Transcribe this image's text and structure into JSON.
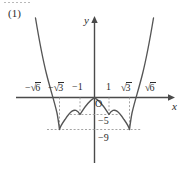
{
  "figure": {
    "index_label": "(1)",
    "axis": {
      "y_label": "y",
      "x_label": "x",
      "origin_label": "O"
    },
    "x_ticks": [
      {
        "id": "neg-sqrt6",
        "label": "-√6",
        "value": -2.449
      },
      {
        "id": "neg-sqrt3",
        "label": "-√3",
        "value": -1.732
      },
      {
        "id": "neg-one",
        "label": "-1",
        "value": -1
      },
      {
        "id": "pos-one",
        "label": "1",
        "value": 1
      },
      {
        "id": "pos-sqrt3",
        "label": "√3",
        "value": 1.732
      },
      {
        "id": "pos-sqrt6",
        "label": "√6",
        "value": 2.449
      }
    ],
    "y_ticks": [
      {
        "id": "neg-five",
        "label": "-5",
        "value": -5
      },
      {
        "id": "neg-nine",
        "label": "-9",
        "value": -9
      }
    ],
    "colors": {
      "curve": "#555555",
      "axis": "#4a4a4a",
      "guide": "#9a9a9a",
      "text": "#2b2b2b",
      "background": "#ffffff"
    }
  },
  "chart_data": {
    "type": "line",
    "title": "",
    "xlabel": "x",
    "ylabel": "y",
    "xlim": [
      -3.05,
      3.05
    ],
    "ylim": [
      -11.5,
      14.0
    ],
    "grid": false,
    "legend": null,
    "function": "y = x^4 - 6x^2",
    "roots": [
      -2.449,
      0,
      2.449
    ],
    "minima": [
      {
        "x": -1.732,
        "y": -9
      },
      {
        "x": 1.732,
        "y": -9
      }
    ],
    "local_maximum": {
      "x": 0,
      "y": 0
    },
    "marked_points": [
      {
        "x": -2.449,
        "y": 0,
        "label": "-√6"
      },
      {
        "x": -1.732,
        "y": -9,
        "label": "-√3"
      },
      {
        "x": -1,
        "y": -5,
        "label": "-1"
      },
      {
        "x": 1,
        "y": -5,
        "label": "1"
      },
      {
        "x": 1.732,
        "y": -9,
        "label": "√3"
      },
      {
        "x": 2.449,
        "y": 0,
        "label": "√6"
      }
    ],
    "guide_lines": {
      "horizontal": [
        -5,
        -9
      ],
      "vertical": [
        -1.732,
        -1,
        1,
        1.732
      ]
    },
    "x": [
      -2.9,
      -2.8,
      -2.7,
      -2.6,
      -2.5,
      -2.449,
      -2.4,
      -2.3,
      -2.2,
      -2.1,
      -2.0,
      -1.9,
      -1.8,
      -1.732,
      -1.7,
      -1.6,
      -1.5,
      -1.4,
      -1.3,
      -1.2,
      -1.1,
      -1.0,
      -0.9,
      -0.8,
      -0.7,
      -0.6,
      -0.5,
      -0.4,
      -0.3,
      -0.2,
      -0.1,
      0.0,
      0.1,
      0.2,
      0.3,
      0.4,
      0.5,
      0.6,
      0.7,
      0.8,
      0.9,
      1.0,
      1.1,
      1.2,
      1.3,
      1.4,
      1.5,
      1.6,
      1.7,
      1.732,
      1.8,
      1.9,
      2.0,
      2.1,
      2.2,
      2.3,
      2.4,
      2.449,
      2.5,
      2.6,
      2.7,
      2.8,
      2.9
    ],
    "y": [
      20.25,
      13.16,
      6.36,
      -0.06,
      -6.06,
      -9.0,
      -7.42,
      -3.76,
      -5.6,
      -6.99,
      -8.0,
      -8.62,
      -8.89,
      -9.0,
      -8.97,
      -8.81,
      -8.44,
      -7.92,
      -7.28,
      -6.56,
      -5.79,
      -5.0,
      -4.2,
      -3.43,
      -2.7,
      -2.03,
      -1.44,
      -0.93,
      -0.53,
      -0.24,
      -0.06,
      0.0,
      -0.06,
      -0.24,
      -0.53,
      -0.93,
      -1.44,
      -2.03,
      -2.7,
      -3.43,
      -4.2,
      -5.0,
      -5.79,
      -6.56,
      -7.28,
      -7.92,
      -8.44,
      -8.81,
      -8.97,
      -9.0,
      -8.89,
      -8.62,
      -8.0,
      -6.99,
      -5.6,
      -3.76,
      -1.46,
      0.0,
      1.36,
      4.76,
      8.75,
      13.16,
      20.25
    ]
  }
}
